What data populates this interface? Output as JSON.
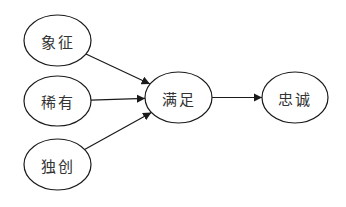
{
  "diagram": {
    "type": "flow",
    "nodes": [
      {
        "id": "symbol",
        "label": "象征",
        "cx": 57.5,
        "cy": 40.5,
        "rx": 33.5,
        "ry": 25.5
      },
      {
        "id": "rare",
        "label": "稀有",
        "cx": 57.5,
        "cy": 101,
        "rx": 33.5,
        "ry": 25
      },
      {
        "id": "unique",
        "label": "独创",
        "cx": 57.5,
        "cy": 164.5,
        "rx": 33.5,
        "ry": 25.5
      },
      {
        "id": "satisfaction",
        "label": "满足",
        "cx": 178.5,
        "cy": 97.5,
        "rx": 33.5,
        "ry": 25.5
      },
      {
        "id": "loyalty",
        "label": "忠诚",
        "cx": 295,
        "cy": 97.5,
        "rx": 33,
        "ry": 25.5
      }
    ],
    "edges": [
      {
        "from": "symbol",
        "to": "satisfaction"
      },
      {
        "from": "rare",
        "to": "satisfaction"
      },
      {
        "from": "unique",
        "to": "satisfaction"
      },
      {
        "from": "satisfaction",
        "to": "loyalty"
      }
    ],
    "colors": {
      "stroke": "#1a1a1a",
      "text": "#333333",
      "background": "#ffffff"
    }
  }
}
